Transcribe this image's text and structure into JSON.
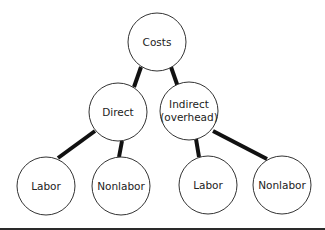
{
  "diagram": {
    "type": "tree",
    "nodes": {
      "costs": {
        "label": "Costs",
        "cx": 157,
        "cy": 42,
        "r": 29
      },
      "direct": {
        "label": "Direct",
        "cx": 118,
        "cy": 112,
        "r": 29
      },
      "indirect": {
        "label_line1": "Indirect",
        "label_line2": "(overhead)",
        "cx": 189,
        "cy": 111,
        "r": 29
      },
      "direct_labor": {
        "label": "Labor",
        "cx": 46,
        "cy": 186,
        "r": 29
      },
      "direct_nonlabor": {
        "label": "Nonlabor",
        "cx": 121,
        "cy": 186,
        "r": 29
      },
      "indirect_labor": {
        "label": "Labor",
        "cx": 208,
        "cy": 185,
        "r": 29
      },
      "indirect_nonlabor": {
        "label": "Nonlabor",
        "cx": 282,
        "cy": 185,
        "r": 29
      }
    },
    "edges": [
      {
        "from": "Costs",
        "to": "Direct"
      },
      {
        "from": "Costs",
        "to": "Indirect (overhead)"
      },
      {
        "from": "Direct",
        "to": "Labor"
      },
      {
        "from": "Direct",
        "to": "Nonlabor"
      },
      {
        "from": "Indirect (overhead)",
        "to": "Labor"
      },
      {
        "from": "Indirect (overhead)",
        "to": "Nonlabor"
      }
    ],
    "colors": {
      "edge": "#111111",
      "node_stroke": "#333333",
      "node_fill": "#ffffff",
      "text": "#222222",
      "bottom_bar": "#2a2a2a"
    }
  }
}
